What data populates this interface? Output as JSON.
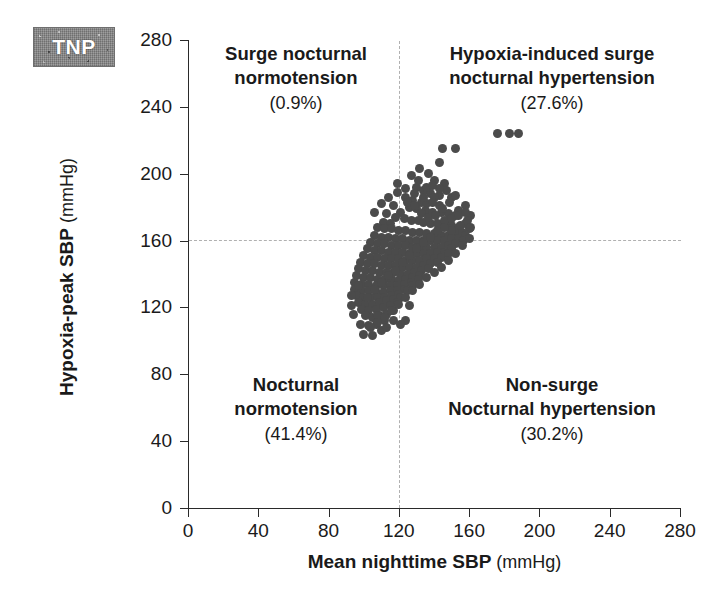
{
  "badge": {
    "label": "TNP"
  },
  "axes": {
    "x": {
      "title": "Mean nighttime SBP",
      "unit": "(mmHg)",
      "ticks": [
        0,
        40,
        80,
        120,
        160,
        200,
        240,
        280
      ],
      "min": 0,
      "max": 280
    },
    "y": {
      "title": "Hypoxia-peak SBP",
      "unit": "(mmHg)",
      "ticks": [
        0,
        40,
        80,
        120,
        160,
        200,
        240,
        280
      ],
      "min": 0,
      "max": 280
    }
  },
  "quadrants": {
    "top_left": {
      "line1": "Surge nocturnal",
      "line2": "normotension",
      "percent": "(0.9%)"
    },
    "top_right": {
      "line1": "Hypoxia-induced surge",
      "line2": "nocturnal hypertension",
      "percent": "(27.6%)"
    },
    "bottom_left": {
      "line1": "Nocturnal",
      "line2": "normotension",
      "percent": "(41.4%)"
    },
    "bottom_right": {
      "line1": "Non-surge",
      "line2": "Nocturnal hypertension",
      "percent": "(30.2%)"
    }
  },
  "colors": {
    "point": "#4b4b4b",
    "axis": "#2a2a2a",
    "reference_line": "#b0b0b0",
    "badge_background": "#8a8a8a",
    "badge_text": "#ffffff"
  },
  "chart_data": {
    "type": "scatter",
    "title": "",
    "xlabel": "Mean nighttime SBP (mmHg)",
    "ylabel": "Hypoxia-peak SBP (mmHg)",
    "xlim": [
      0,
      280
    ],
    "ylim": [
      0,
      280
    ],
    "xticks": [
      0,
      40,
      80,
      120,
      160,
      200,
      240,
      280
    ],
    "yticks": [
      0,
      40,
      80,
      120,
      160,
      200,
      240,
      280
    ],
    "grid": false,
    "legend": null,
    "reference_lines": {
      "hline_y": 160,
      "vline_x": 120
    },
    "annotations": [
      {
        "text": "Surge nocturnal normotension (0.9%)",
        "quadrant": "top-left"
      },
      {
        "text": "Hypoxia-induced surge nocturnal hypertension (27.6%)",
        "quadrant": "top-right"
      },
      {
        "text": "Nocturnal normotension (41.4%)",
        "quadrant": "bottom-left"
      },
      {
        "text": "Non-surge Nocturnal hypertension (30.2%)",
        "quadrant": "bottom-right"
      }
    ],
    "marker": {
      "shape": "circle",
      "color": "#4b4b4b",
      "size": 9
    },
    "points": [
      [
        176,
        224
      ],
      [
        183,
        224
      ],
      [
        188,
        224
      ],
      [
        145,
        215
      ],
      [
        152,
        215
      ],
      [
        143,
        207
      ],
      [
        132,
        203
      ],
      [
        137,
        200
      ],
      [
        140,
        196
      ],
      [
        146,
        194
      ],
      [
        130,
        192
      ],
      [
        134,
        190
      ],
      [
        138,
        188
      ],
      [
        143,
        187
      ],
      [
        150,
        186
      ],
      [
        119,
        189
      ],
      [
        124,
        186
      ],
      [
        128,
        184
      ],
      [
        133,
        183
      ],
      [
        136,
        182
      ],
      [
        126,
        180
      ],
      [
        130,
        179
      ],
      [
        135,
        178
      ],
      [
        139,
        177
      ],
      [
        144,
        177
      ],
      [
        148,
        176
      ],
      [
        152,
        175
      ],
      [
        121,
        177
      ],
      [
        117,
        181
      ],
      [
        113,
        176
      ],
      [
        118,
        174
      ],
      [
        123,
        173
      ],
      [
        127,
        172
      ],
      [
        131,
        172
      ],
      [
        134,
        171
      ],
      [
        138,
        170
      ],
      [
        142,
        170
      ],
      [
        146,
        169
      ],
      [
        150,
        169
      ],
      [
        154,
        168
      ],
      [
        158,
        170
      ],
      [
        111,
        171
      ],
      [
        115,
        170
      ],
      [
        108,
        168
      ],
      [
        112,
        167
      ],
      [
        116,
        167
      ],
      [
        120,
        166
      ],
      [
        124,
        166
      ],
      [
        128,
        165
      ],
      [
        132,
        165
      ],
      [
        136,
        164
      ],
      [
        140,
        164
      ],
      [
        144,
        163
      ],
      [
        148,
        163
      ],
      [
        152,
        164
      ],
      [
        156,
        165
      ],
      [
        160,
        167
      ],
      [
        106,
        163
      ],
      [
        110,
        162
      ],
      [
        114,
        162
      ],
      [
        118,
        161
      ],
      [
        122,
        161
      ],
      [
        126,
        160
      ],
      [
        130,
        160
      ],
      [
        134,
        160
      ],
      [
        138,
        160
      ],
      [
        142,
        160
      ],
      [
        146,
        160
      ],
      [
        150,
        161
      ],
      [
        154,
        161
      ],
      [
        158,
        163
      ],
      [
        104,
        159
      ],
      [
        108,
        158
      ],
      [
        112,
        158
      ],
      [
        116,
        157
      ],
      [
        120,
        157
      ],
      [
        124,
        157
      ],
      [
        128,
        156
      ],
      [
        132,
        156
      ],
      [
        136,
        156
      ],
      [
        140,
        156
      ],
      [
        144,
        156
      ],
      [
        148,
        157
      ],
      [
        152,
        158
      ],
      [
        157,
        160
      ],
      [
        102,
        155
      ],
      [
        106,
        154
      ],
      [
        110,
        154
      ],
      [
        114,
        153
      ],
      [
        118,
        153
      ],
      [
        122,
        153
      ],
      [
        126,
        152
      ],
      [
        130,
        152
      ],
      [
        134,
        152
      ],
      [
        138,
        152
      ],
      [
        142,
        153
      ],
      [
        146,
        153
      ],
      [
        150,
        155
      ],
      [
        100,
        151
      ],
      [
        104,
        150
      ],
      [
        108,
        150
      ],
      [
        112,
        149
      ],
      [
        116,
        149
      ],
      [
        120,
        149
      ],
      [
        124,
        148
      ],
      [
        128,
        148
      ],
      [
        132,
        148
      ],
      [
        136,
        149
      ],
      [
        140,
        149
      ],
      [
        144,
        150
      ],
      [
        148,
        152
      ],
      [
        98,
        147
      ],
      [
        102,
        146
      ],
      [
        106,
        146
      ],
      [
        110,
        145
      ],
      [
        114,
        145
      ],
      [
        118,
        145
      ],
      [
        122,
        144
      ],
      [
        126,
        144
      ],
      [
        130,
        144
      ],
      [
        134,
        145
      ],
      [
        138,
        146
      ],
      [
        142,
        147
      ],
      [
        97,
        143
      ],
      [
        101,
        142
      ],
      [
        105,
        142
      ],
      [
        109,
        141
      ],
      [
        113,
        141
      ],
      [
        117,
        141
      ],
      [
        121,
        140
      ],
      [
        125,
        140
      ],
      [
        129,
        141
      ],
      [
        133,
        142
      ],
      [
        137,
        143
      ],
      [
        96,
        139
      ],
      [
        100,
        138
      ],
      [
        104,
        138
      ],
      [
        108,
        137
      ],
      [
        112,
        137
      ],
      [
        116,
        137
      ],
      [
        120,
        136
      ],
      [
        124,
        137
      ],
      [
        128,
        138
      ],
      [
        132,
        139
      ],
      [
        95,
        135
      ],
      [
        99,
        134
      ],
      [
        103,
        134
      ],
      [
        107,
        133
      ],
      [
        111,
        133
      ],
      [
        115,
        133
      ],
      [
        119,
        133
      ],
      [
        123,
        134
      ],
      [
        127,
        135
      ],
      [
        131,
        137
      ],
      [
        95,
        131
      ],
      [
        99,
        130
      ],
      [
        103,
        130
      ],
      [
        107,
        129
      ],
      [
        111,
        129
      ],
      [
        115,
        130
      ],
      [
        119,
        130
      ],
      [
        123,
        131
      ],
      [
        128,
        133
      ],
      [
        96,
        127
      ],
      [
        100,
        126
      ],
      [
        104,
        126
      ],
      [
        108,
        126
      ],
      [
        112,
        126
      ],
      [
        116,
        127
      ],
      [
        120,
        128
      ],
      [
        125,
        130
      ],
      [
        97,
        123
      ],
      [
        101,
        122
      ],
      [
        105,
        122
      ],
      [
        109,
        123
      ],
      [
        113,
        124
      ],
      [
        117,
        125
      ],
      [
        121,
        126
      ],
      [
        99,
        119
      ],
      [
        103,
        118
      ],
      [
        107,
        119
      ],
      [
        111,
        120
      ],
      [
        115,
        121
      ],
      [
        119,
        123
      ],
      [
        126,
        121
      ],
      [
        101,
        115
      ],
      [
        105,
        114
      ],
      [
        109,
        115
      ],
      [
        113,
        116
      ],
      [
        117,
        118
      ],
      [
        124,
        112
      ],
      [
        98,
        110
      ],
      [
        103,
        109
      ],
      [
        107,
        110
      ],
      [
        112,
        112
      ],
      [
        100,
        104
      ],
      [
        105,
        103
      ],
      [
        110,
        106
      ],
      [
        149,
        172
      ],
      [
        154,
        178
      ],
      [
        158,
        181
      ],
      [
        161,
        175
      ],
      [
        140,
        186
      ],
      [
        136,
        192
      ],
      [
        131,
        196
      ],
      [
        127,
        199
      ],
      [
        119,
        194
      ],
      [
        114,
        186
      ],
      [
        110,
        182
      ],
      [
        106,
        177
      ],
      [
        155,
        169
      ],
      [
        159,
        172
      ],
      [
        150,
        166
      ],
      [
        146,
        172
      ],
      [
        143,
        181
      ],
      [
        139,
        183
      ],
      [
        134,
        186
      ],
      [
        129,
        188
      ],
      [
        124,
        191
      ],
      [
        125,
        183
      ],
      [
        129,
        181
      ],
      [
        133,
        176
      ],
      [
        137,
        174
      ],
      [
        141,
        175
      ],
      [
        145,
        179
      ],
      [
        149,
        183
      ],
      [
        152,
        187
      ],
      [
        147,
        190
      ],
      [
        143,
        191
      ],
      [
        139,
        193
      ],
      [
        93,
        121
      ],
      [
        94,
        116
      ],
      [
        97,
        133
      ],
      [
        93,
        127
      ],
      [
        117,
        112
      ],
      [
        121,
        110
      ],
      [
        113,
        108
      ],
      [
        108,
        115
      ],
      [
        102,
        126
      ],
      [
        106,
        131
      ],
      [
        110,
        135
      ],
      [
        114,
        139
      ],
      [
        118,
        142
      ],
      [
        122,
        147
      ],
      [
        126,
        151
      ],
      [
        130,
        155
      ],
      [
        134,
        159
      ],
      [
        138,
        162
      ],
      [
        142,
        166
      ],
      [
        146,
        168
      ],
      [
        150,
        173
      ],
      [
        154,
        175
      ],
      [
        158,
        177
      ],
      [
        161,
        168
      ],
      [
        160,
        161
      ],
      [
        156,
        157
      ],
      [
        152,
        152
      ],
      [
        148,
        148
      ],
      [
        144,
        144
      ],
      [
        140,
        141
      ],
      [
        136,
        138
      ],
      [
        132,
        134
      ],
      [
        128,
        130
      ],
      [
        124,
        126
      ],
      [
        120,
        122
      ],
      [
        116,
        118
      ],
      [
        112,
        114
      ],
      [
        108,
        111
      ],
      [
        104,
        108
      ]
    ],
    "n_points": 258
  }
}
